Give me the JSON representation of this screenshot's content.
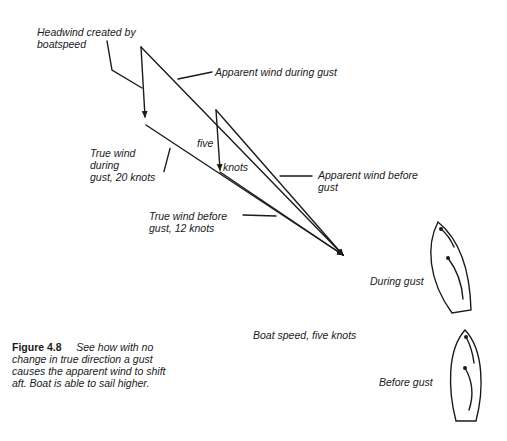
{
  "figure": {
    "number": "Figure 4.8",
    "caption": "See how with no change in true direction a gust causes the apparent wind to shift aft. Boat is able to sail higher.",
    "caption_lines": [
      "See how with no",
      "change in true direction a gust",
      "causes the apparent wind to shift",
      "aft. Boat is able to sail higher."
    ]
  },
  "labels": {
    "headwind": [
      "Headwind created by",
      "boatspeed"
    ],
    "apparent_during": "Apparent wind during gust",
    "true_during": [
      "True wind",
      "during",
      "gust, 20 knots"
    ],
    "five": "five",
    "knots": "knots",
    "apparent_before": [
      "Apparent wind before",
      "gust"
    ],
    "true_before": [
      "True wind before",
      "gust, 12 knots"
    ],
    "during_gust": "During gust",
    "boat_speed": "Boat speed, five knots",
    "before_gust": "Before gust"
  },
  "colors": {
    "ink": "#1a1a1a",
    "background": "#ffffff"
  }
}
